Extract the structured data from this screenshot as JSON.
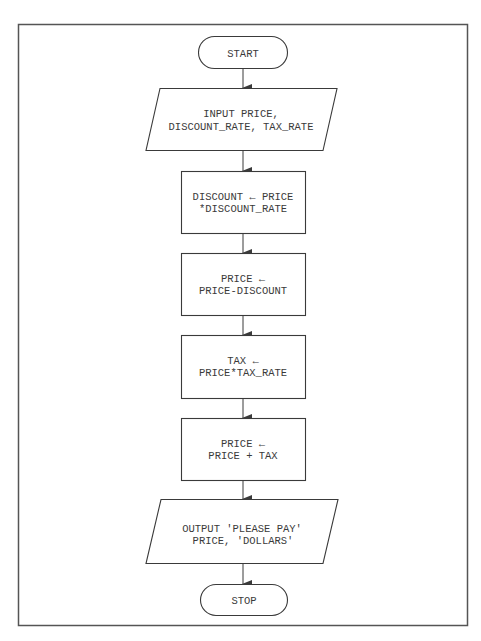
{
  "flowchart": {
    "colors": {
      "stroke": "#3a3a3a",
      "background": "#ffffff",
      "text": "#3a3a3a"
    },
    "nodes": [
      {
        "id": "start",
        "type": "terminal",
        "lines": [
          "START"
        ]
      },
      {
        "id": "input",
        "type": "io",
        "lines": [
          "INPUT PRICE,",
          "DISCOUNT_RATE, TAX_RATE"
        ]
      },
      {
        "id": "calc-discount",
        "type": "process",
        "lines": [
          "DISCOUNT ← PRICE",
          "*DISCOUNT_RATE"
        ]
      },
      {
        "id": "apply-discount",
        "type": "process",
        "lines": [
          "PRICE ←",
          "PRICE-DISCOUNT"
        ]
      },
      {
        "id": "calc-tax",
        "type": "process",
        "lines": [
          "TAX ←",
          "PRICE*TAX_RATE"
        ]
      },
      {
        "id": "apply-tax",
        "type": "process",
        "lines": [
          "PRICE ←",
          "PRICE + TAX"
        ]
      },
      {
        "id": "output",
        "type": "io",
        "lines": [
          "OUTPUT 'PLEASE PAY'",
          "PRICE, 'DOLLARS'"
        ]
      },
      {
        "id": "stop",
        "type": "terminal",
        "lines": [
          "STOP"
        ]
      }
    ],
    "edges": [
      [
        "start",
        "input"
      ],
      [
        "input",
        "calc-discount"
      ],
      [
        "calc-discount",
        "apply-discount"
      ],
      [
        "apply-discount",
        "calc-tax"
      ],
      [
        "calc-tax",
        "apply-tax"
      ],
      [
        "apply-tax",
        "output"
      ],
      [
        "output",
        "stop"
      ]
    ]
  }
}
